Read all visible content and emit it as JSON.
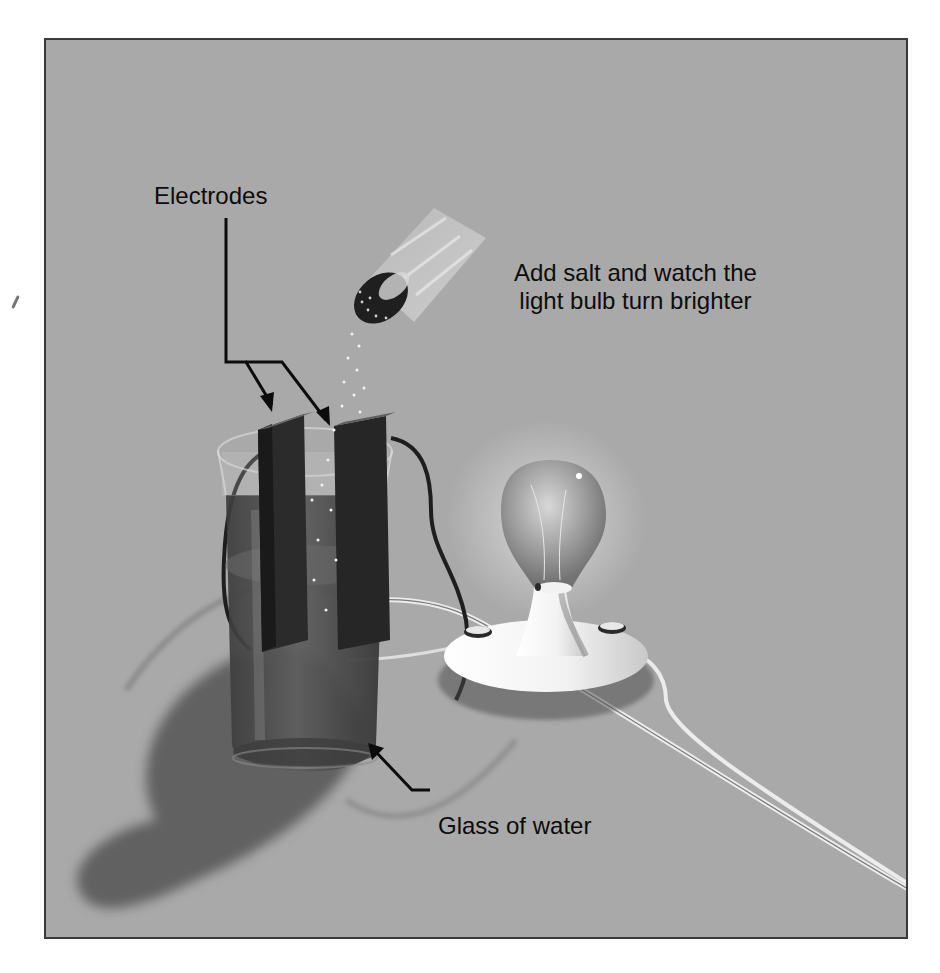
{
  "figure": {
    "labels": {
      "electrodes": "Electrodes",
      "caption_line1": "Add salt and watch the",
      "caption_line2": "light bulb turn brighter",
      "glass": "Glass of water"
    },
    "objects": [
      "salt-shaker",
      "electrodes",
      "glass-of-water",
      "light-bulb",
      "bulb-base",
      "wires",
      "shadow"
    ],
    "colors": {
      "background": "#a9a9a9",
      "frame_border": "#3a3a3a",
      "text": "#0c0c0c",
      "electrode": "#2a2a2a",
      "water": "#4a4a4a",
      "bulb_base": "#f4f4f4",
      "shadow": "#555555"
    }
  }
}
